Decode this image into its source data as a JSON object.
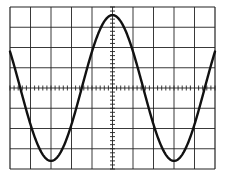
{
  "chart_data": {
    "type": "line",
    "title": "",
    "xlabel": "",
    "ylabel": "",
    "grid": true,
    "legend": null,
    "graticule": {
      "x_divisions": 10,
      "y_divisions": 8,
      "minor_ticks_per_division": 5,
      "center_axes_with_minor_ticks": true
    },
    "xlim": [
      -5,
      5
    ],
    "ylim": [
      -4,
      4
    ],
    "series": [
      {
        "name": "waveform",
        "shape": "sine",
        "period_divisions": 6.0,
        "amplitude_divisions": 3.6,
        "offset_divisions": 0,
        "phase": "peak at x=0",
        "x": [
          -5,
          -4.5,
          -3,
          -1.5,
          0,
          1.5,
          3,
          4.5,
          5
        ],
        "y": [
          1.8,
          0,
          -3.6,
          0,
          3.6,
          0,
          -3.6,
          0,
          1.0
        ]
      }
    ],
    "colors": {
      "background": "#ffffff",
      "grid": "#222222",
      "trace": "#111111"
    }
  }
}
